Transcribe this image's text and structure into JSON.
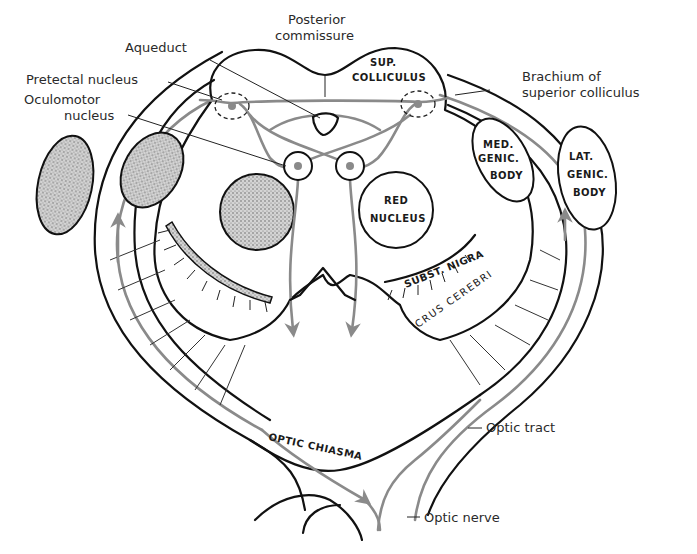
{
  "figure": {
    "colors": {
      "outline": "#111111",
      "pathway": "#8a8a8a",
      "stipple": "#bdbdbd",
      "background": "#ffffff"
    }
  },
  "labels": {
    "posterior_commissure_line1": "Posterior",
    "posterior_commissure_line2": "commissure",
    "aqueduct": "Aqueduct",
    "pretectal_nucleus": "Pretectal nucleus",
    "oculomotor_line1": "Oculomotor",
    "oculomotor_line2": "nucleus",
    "brachium_line1": "Brachium of",
    "brachium_line2": "superior colliculus",
    "optic_tract": "Optic tract",
    "optic_nerve": "Optic nerve"
  },
  "structures": {
    "sup_colliculus_line1": "SUP.",
    "sup_colliculus_line2": "COLLICULUS",
    "med_genic_line1": "MED.",
    "med_genic_line2": "GENIC.",
    "med_genic_line3": "BODY",
    "lat_genic_line1": "LAT.",
    "lat_genic_line2": "GENIC.",
    "lat_genic_line3": "BODY",
    "red_nucleus_line1": "RED",
    "red_nucleus_line2": "NUCLEUS",
    "subst_nigra": "SUBST. NIGRA",
    "crus_cerebri": "CRUS CEREBRI",
    "optic_chiasma": "OPTIC CHIASMA"
  }
}
